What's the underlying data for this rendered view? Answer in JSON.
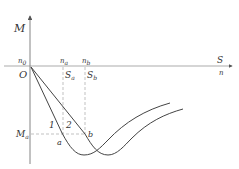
{
  "diagram": {
    "type": "torque-speed / slip curves",
    "axes": {
      "y_label": "M",
      "x_label_top": "S",
      "x_label_bottom": "n",
      "origin_label": "O",
      "origin_speed_label": "n0",
      "origin_speed_base": "n",
      "origin_speed_sub": "0"
    },
    "markers": {
      "na": {
        "base": "n",
        "sub": "a"
      },
      "nb": {
        "base": "n",
        "sub": "b"
      },
      "Sa": {
        "base": "S",
        "sub": "a"
      },
      "Sb": {
        "base": "S",
        "sub": "b"
      },
      "Ma": {
        "base": "M",
        "sub": "a"
      }
    },
    "points": {
      "a": "a",
      "b": "b"
    },
    "curves": [
      {
        "id": "1",
        "label": "1"
      },
      {
        "id": "2",
        "label": "2"
      }
    ],
    "colors": {
      "axis": "#555555",
      "curve": "#444444",
      "dashed": "#888888",
      "text": "#333333"
    }
  }
}
